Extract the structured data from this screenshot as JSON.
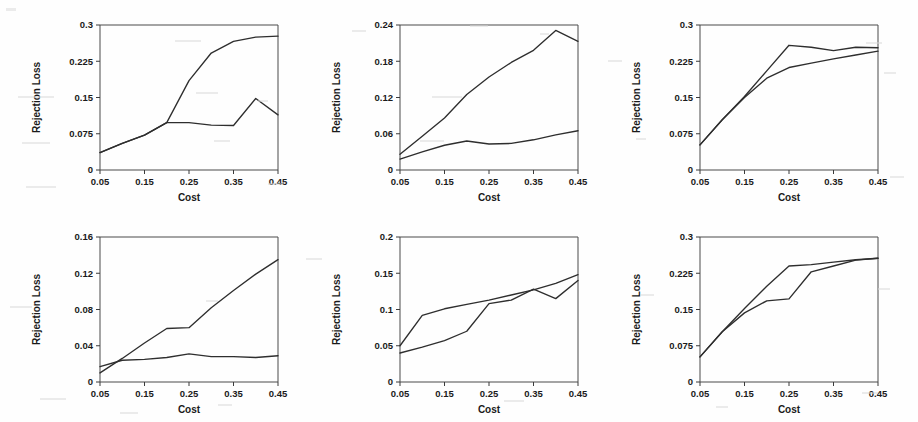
{
  "chart_data": [
    {
      "id": "panel-1",
      "position": "top-left",
      "type": "line",
      "title": "",
      "xlabel": "Cost",
      "ylabel": "Rejection Loss",
      "xlim": [
        0.05,
        0.45
      ],
      "ylim": [
        0,
        0.3
      ],
      "xticks": [
        0.05,
        0.15,
        0.25,
        0.35,
        0.45
      ],
      "xticklabels": [
        "0.05",
        "0.15",
        "0.25",
        "0.35",
        "0.45"
      ],
      "yticks": [
        0,
        0.075,
        0.15,
        0.225,
        0.3
      ],
      "yticklabels": [
        "0",
        "0.075",
        "0.15",
        "0.225",
        "0.3"
      ],
      "grid": false,
      "legend": "none",
      "x": [
        0.05,
        0.1,
        0.15,
        0.2,
        0.25,
        0.3,
        0.35,
        0.4,
        0.45
      ],
      "series": [
        {
          "name": "curve-upper",
          "values": [
            0.036,
            0.055,
            0.072,
            0.098,
            0.185,
            0.242,
            0.266,
            0.275,
            0.277
          ]
        },
        {
          "name": "curve-lower",
          "values": [
            0.036,
            0.055,
            0.072,
            0.098,
            0.098,
            0.093,
            0.092,
            0.148,
            0.114
          ]
        }
      ]
    },
    {
      "id": "panel-2",
      "position": "top-center",
      "type": "line",
      "title": "",
      "xlabel": "Cost",
      "ylabel": "Rejection Loss",
      "xlim": [
        0.05,
        0.45
      ],
      "ylim": [
        0,
        0.24
      ],
      "xticks": [
        0.05,
        0.15,
        0.25,
        0.35,
        0.45
      ],
      "xticklabels": [
        "0.05",
        "0.15",
        "0.25",
        "0.35",
        "0.45"
      ],
      "yticks": [
        0,
        0.06,
        0.12,
        0.18,
        0.24
      ],
      "yticklabels": [
        "0",
        "0.06",
        "0.12",
        "0.18",
        "0.24"
      ],
      "grid": false,
      "legend": "none",
      "x": [
        0.05,
        0.1,
        0.15,
        0.2,
        0.25,
        0.3,
        0.35,
        0.4,
        0.45
      ],
      "series": [
        {
          "name": "curve-upper",
          "values": [
            0.026,
            0.056,
            0.086,
            0.125,
            0.154,
            0.178,
            0.198,
            0.231,
            0.213
          ]
        },
        {
          "name": "curve-lower",
          "values": [
            0.018,
            0.03,
            0.041,
            0.048,
            0.043,
            0.044,
            0.05,
            0.058,
            0.065
          ]
        }
      ]
    },
    {
      "id": "panel-3",
      "position": "top-right",
      "type": "line",
      "title": "",
      "xlabel": "Cost",
      "ylabel": "Rejection Loss",
      "xlim": [
        0.05,
        0.45
      ],
      "ylim": [
        0,
        0.3
      ],
      "xticks": [
        0.05,
        0.15,
        0.25,
        0.35,
        0.45
      ],
      "xticklabels": [
        "0.05",
        "0.15",
        "0.25",
        "0.35",
        "0.45"
      ],
      "yticks": [
        0,
        0.075,
        0.15,
        0.225,
        0.3
      ],
      "yticklabels": [
        "0",
        "0.075",
        "0.15",
        "0.225",
        "0.3"
      ],
      "grid": false,
      "legend": "none",
      "x": [
        0.05,
        0.1,
        0.15,
        0.2,
        0.25,
        0.3,
        0.35,
        0.4,
        0.45
      ],
      "series": [
        {
          "name": "curve-upper",
          "values": [
            0.052,
            0.104,
            0.152,
            0.205,
            0.258,
            0.254,
            0.247,
            0.254,
            0.253
          ]
        },
        {
          "name": "curve-lower",
          "values": [
            0.052,
            0.104,
            0.15,
            0.19,
            0.212,
            0.221,
            0.23,
            0.238,
            0.246
          ]
        }
      ]
    },
    {
      "id": "panel-4",
      "position": "bottom-left",
      "type": "line",
      "title": "",
      "xlabel": "Cost",
      "ylabel": "Rejection Loss",
      "xlim": [
        0.05,
        0.45
      ],
      "ylim": [
        0,
        0.16
      ],
      "xticks": [
        0.05,
        0.15,
        0.25,
        0.35,
        0.45
      ],
      "xticklabels": [
        "0.05",
        "0.15",
        "0.25",
        "0.35",
        "0.45"
      ],
      "yticks": [
        0,
        0.04,
        0.08,
        0.12,
        0.16
      ],
      "yticklabels": [
        "0",
        "0.04",
        "0.08",
        "0.12",
        "0.16"
      ],
      "grid": false,
      "legend": "none",
      "x": [
        0.05,
        0.1,
        0.15,
        0.2,
        0.25,
        0.3,
        0.35,
        0.4,
        0.45
      ],
      "series": [
        {
          "name": "curve-upper",
          "values": [
            0.01,
            0.026,
            0.043,
            0.059,
            0.06,
            0.082,
            0.101,
            0.119,
            0.135
          ]
        },
        {
          "name": "curve-lower",
          "values": [
            0.017,
            0.024,
            0.025,
            0.027,
            0.031,
            0.028,
            0.028,
            0.027,
            0.029
          ]
        }
      ]
    },
    {
      "id": "panel-5",
      "position": "bottom-center",
      "type": "line",
      "title": "",
      "xlabel": "Cost",
      "ylabel": "Rejection Loss",
      "xlim": [
        0.05,
        0.45
      ],
      "ylim": [
        0,
        0.2
      ],
      "xticks": [
        0.05,
        0.15,
        0.25,
        0.35,
        0.45
      ],
      "xticklabels": [
        "0.05",
        "0.15",
        "0.25",
        "0.35",
        "0.45"
      ],
      "yticks": [
        0,
        0.05,
        0.1,
        0.15,
        0.2
      ],
      "yticklabels": [
        "0",
        "0.05",
        "0.1",
        "0.15",
        "0.2"
      ],
      "grid": false,
      "legend": "none",
      "x": [
        0.05,
        0.1,
        0.15,
        0.2,
        0.25,
        0.3,
        0.35,
        0.4,
        0.45
      ],
      "series": [
        {
          "name": "curve-upper",
          "values": [
            0.05,
            0.092,
            0.101,
            0.107,
            0.113,
            0.12,
            0.127,
            0.136,
            0.148
          ]
        },
        {
          "name": "curve-lower",
          "values": [
            0.04,
            0.048,
            0.057,
            0.07,
            0.108,
            0.113,
            0.128,
            0.115,
            0.14
          ]
        }
      ]
    },
    {
      "id": "panel-6",
      "position": "bottom-right",
      "type": "line",
      "title": "",
      "xlabel": "Cost",
      "ylabel": "Rejection Loss",
      "xlim": [
        0.05,
        0.45
      ],
      "ylim": [
        0,
        0.3
      ],
      "xticks": [
        0.05,
        0.15,
        0.25,
        0.35,
        0.45
      ],
      "xticklabels": [
        "0.05",
        "0.15",
        "0.25",
        "0.35",
        "0.45"
      ],
      "yticks": [
        0,
        0.075,
        0.15,
        0.225,
        0.3
      ],
      "yticklabels": [
        "0",
        "0.075",
        "0.15",
        "0.225",
        "0.3"
      ],
      "grid": false,
      "legend": "none",
      "x": [
        0.05,
        0.1,
        0.15,
        0.2,
        0.25,
        0.3,
        0.35,
        0.4,
        0.45
      ],
      "series": [
        {
          "name": "curve-upper",
          "values": [
            0.052,
            0.104,
            0.152,
            0.198,
            0.24,
            0.243,
            0.248,
            0.253,
            0.256
          ]
        },
        {
          "name": "curve-lower",
          "values": [
            0.052,
            0.104,
            0.143,
            0.168,
            0.172,
            0.228,
            0.24,
            0.252,
            0.256
          ]
        }
      ]
    }
  ],
  "style": {
    "line_color": "#2e2e2e",
    "axis_color": "#3a3a3a",
    "text_color": "#1a1a1a",
    "background": "#fefefe"
  },
  "layout": {
    "rows": 2,
    "cols": 3,
    "panel_width": 306,
    "panel_height": 211
  }
}
